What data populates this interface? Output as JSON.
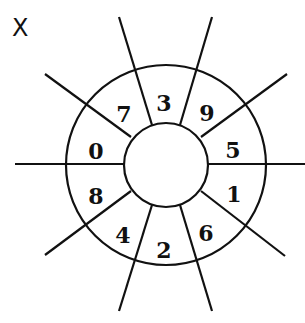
{
  "figure": {
    "label": "X",
    "center": [
      166,
      165
    ],
    "outer_radius": 100,
    "inner_radius": 42,
    "stroke_color": "#111111",
    "segments": [
      {
        "number": "3",
        "x": 164,
        "y": 103
      },
      {
        "number": "9",
        "x": 207,
        "y": 113
      },
      {
        "number": "5",
        "x": 233,
        "y": 150
      },
      {
        "number": "1",
        "x": 234,
        "y": 194
      },
      {
        "number": "6",
        "x": 206,
        "y": 233
      },
      {
        "number": "2",
        "x": 164,
        "y": 250
      },
      {
        "number": "4",
        "x": 123,
        "y": 235
      },
      {
        "number": "8",
        "x": 96,
        "y": 196
      },
      {
        "number": "0",
        "x": 96,
        "y": 151
      },
      {
        "number": "7",
        "x": 124,
        "y": 114
      }
    ],
    "spokes": [
      [
        15,
        164,
        124,
        164
      ],
      [
        208,
        164,
        305,
        164
      ],
      [
        119,
        17,
        152,
        125
      ],
      [
        212,
        17,
        180,
        125
      ],
      [
        45,
        74,
        131,
        137
      ],
      [
        287,
        74,
        201,
        137
      ],
      [
        45,
        255,
        131,
        191
      ],
      [
        285,
        256,
        201,
        191
      ],
      [
        119,
        311,
        152,
        205
      ],
      [
        212,
        311,
        180,
        205
      ]
    ]
  }
}
